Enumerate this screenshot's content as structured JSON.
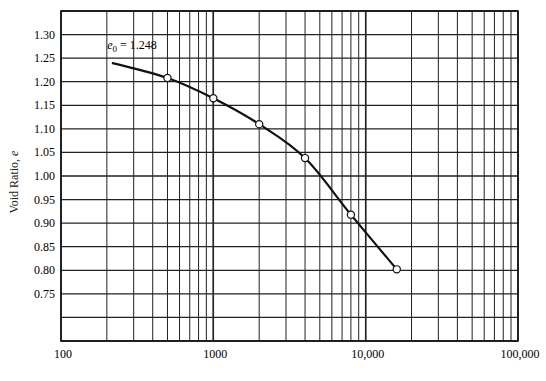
{
  "chart_data": {
    "type": "line",
    "title": "",
    "xlabel": "",
    "ylabel": "Void Ratio, e",
    "xscale": "log",
    "xlim": [
      100,
      100000
    ],
    "ylim": [
      0.65,
      1.35
    ],
    "x_ticks": [
      "100",
      "1000",
      "10,000",
      "100,000"
    ],
    "y_ticks": [
      "1.30",
      "1.25",
      "1.20",
      "1.15",
      "1.10",
      "1.05",
      "1.00",
      "0.95",
      "0.90",
      "0.85",
      "0.80",
      "0.75"
    ],
    "grid": true,
    "annotation": {
      "text_prefix": "e",
      "subscript": "0",
      "text_suffix": " = 1.248"
    },
    "curve": {
      "x": [
        216,
        500,
        1000,
        2000,
        4000,
        8000,
        16000
      ],
      "y": [
        1.24,
        1.208,
        1.165,
        1.11,
        1.038,
        0.918,
        0.802
      ]
    },
    "series": [
      {
        "name": "Measured",
        "marker": "open-circle",
        "x": [
          500,
          1000,
          2000,
          4000,
          8000,
          16000
        ],
        "y": [
          1.208,
          1.165,
          1.11,
          1.038,
          0.918,
          0.802
        ]
      }
    ]
  }
}
